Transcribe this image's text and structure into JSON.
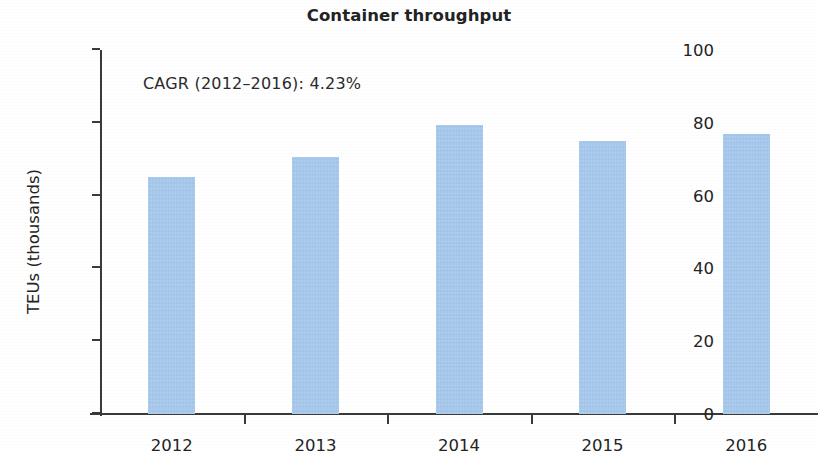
{
  "chart_data": {
    "type": "bar",
    "title": "Container throughput",
    "xlabel": "",
    "ylabel": "TEUs (thousands)",
    "categories": [
      "2012",
      "2013",
      "2014",
      "2015",
      "2016"
    ],
    "values": [
      65,
      70.5,
      79.5,
      75,
      77
    ],
    "series": [
      {
        "name": "Container throughput",
        "values": [
          65,
          70.5,
          79.5,
          75,
          77
        ]
      }
    ],
    "ylim": [
      0,
      100
    ],
    "yticks": [
      0,
      20,
      40,
      60,
      80,
      100
    ],
    "ytick_labels": [
      "0",
      "20",
      "40",
      "60",
      "80",
      "100"
    ],
    "grid": false,
    "legend": false,
    "legend_position": "none",
    "bar_color": "#a8cbf0",
    "axis_color": "#3a3a3a",
    "text_color": "#232323",
    "annotations": [
      {
        "text": "CAGR (2012–2016): 4.23%",
        "x": "2012",
        "y": 92
      }
    ]
  }
}
